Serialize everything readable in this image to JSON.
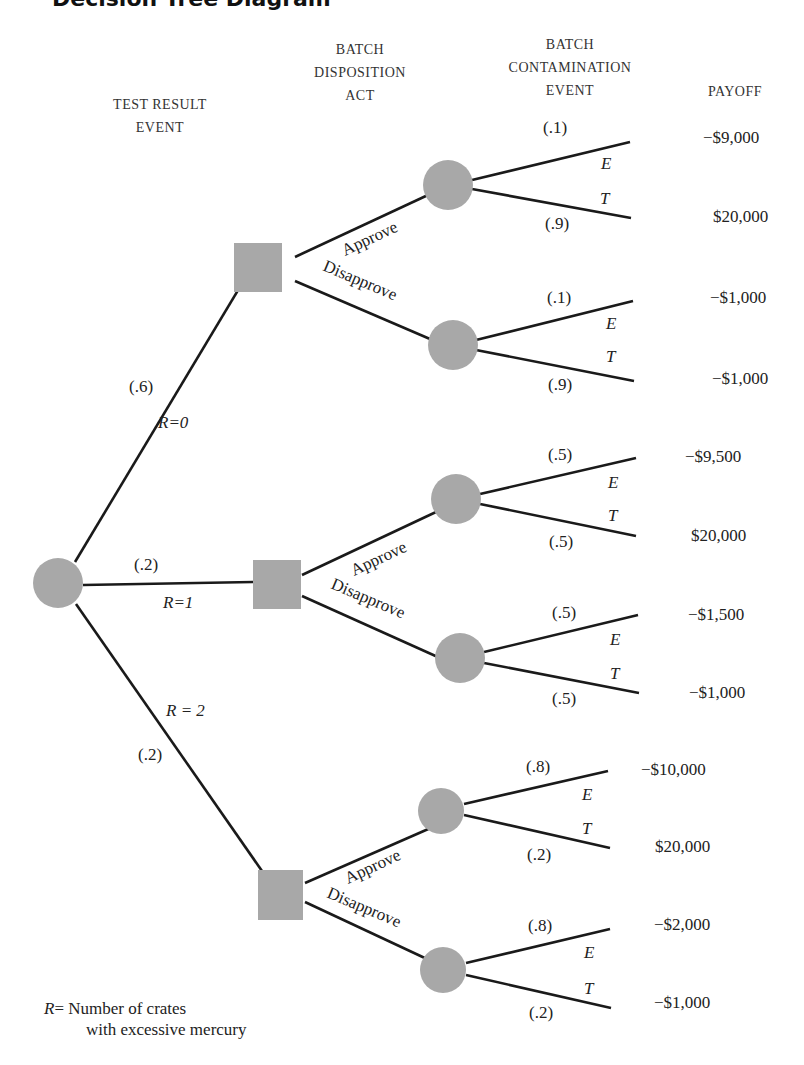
{
  "title_fragment": "Decision Tree Diagram",
  "headers": {
    "test_result": [
      "TEST RESULT",
      "EVENT"
    ],
    "disposition": [
      "BATCH",
      "DISPOSITION",
      "ACT"
    ],
    "contamination": [
      "BATCH",
      "CONTAMINATION",
      "EVENT"
    ],
    "payoff": [
      "PAYOFF"
    ]
  },
  "root": {
    "type": "chance",
    "branches": [
      {
        "event": "R=0",
        "prob": "(.6)"
      },
      {
        "event": "R=1",
        "prob": "(.2)"
      },
      {
        "event": "R = 2",
        "prob": "(.2)"
      }
    ]
  },
  "acts": {
    "approve": "Approve",
    "disapprove": "Disapprove"
  },
  "outcome_labels": {
    "E": "E",
    "T": "T"
  },
  "subtrees": [
    {
      "R": "R=0",
      "approve": {
        "probE": "(.1)",
        "probT": "(.9)",
        "payE": "−$9,000",
        "payT": "$20,000"
      },
      "disapprove": {
        "probE": "(.1)",
        "probT": "(.9)",
        "payE": "−$1,000",
        "payT": "−$1,000"
      }
    },
    {
      "R": "R=1",
      "approve": {
        "probE": "(.5)",
        "probT": "(.5)",
        "payE": "−$9,500",
        "payT": "$20,000"
      },
      "disapprove": {
        "probE": "(.5)",
        "probT": "(.5)",
        "payE": "−$1,500",
        "payT": "−$1,000"
      }
    },
    {
      "R": "R = 2",
      "approve": {
        "probE": "(.8)",
        "probT": "(.2)",
        "payE": "−$10,000",
        "payT": "$20,000"
      },
      "disapprove": {
        "probE": "(.8)",
        "probT": "(.2)",
        "payE": "−$2,000",
        "payT": "−$1,000"
      }
    }
  ],
  "legend": {
    "symbol": "R",
    "eq": "=",
    "line1": "Number of crates",
    "line2": "with excessive mercury"
  },
  "colors": {
    "node_fill": "#a8a8a8",
    "line": "#1a1a1a"
  }
}
